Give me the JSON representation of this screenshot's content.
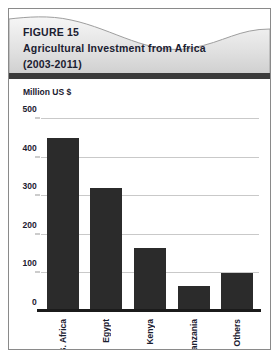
{
  "figure": {
    "label": "FIGURE 15",
    "title": "Agricultural Investment from Africa",
    "period": "(2003-2011)"
  },
  "colors": {
    "bar": "#2b2b2b",
    "banner_light": "#f2f2f2",
    "banner_dark": "#d2d2d2",
    "rule": "#3b3b3b",
    "grid": "#c9c9c9",
    "text": "#1b2030",
    "border": "#8a8a8a"
  },
  "chart_data": {
    "type": "bar",
    "title": "Agricultural Investment from Africa (2003-2011)",
    "xlabel": "",
    "ylabel": "Million US $",
    "categories": [
      "S. Africa",
      "Egypt",
      "Kenya",
      "Tanzania",
      "Others"
    ],
    "values": [
      450,
      320,
      165,
      68,
      100
    ],
    "yticks": [
      0,
      100,
      200,
      300,
      400,
      500
    ],
    "ylim": [
      0,
      500
    ],
    "grid": true,
    "legend": false
  }
}
